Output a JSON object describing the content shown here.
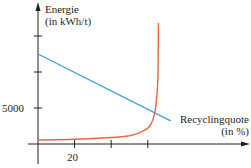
{
  "chart_data": {
    "type": "line",
    "title": "",
    "ylabel": "Energie (in kWh/t)",
    "xlabel": "Recyclingquote (in %)",
    "ylabel_lines": [
      "Energie",
      "(in kWh/t)"
    ],
    "xlabel_lines": [
      "Recyclingquote",
      "(in %)"
    ],
    "x_ticks": [
      20,
      40,
      60
    ],
    "x_tick_labels": [
      "20"
    ],
    "y_ticks": [
      5000,
      10000,
      15000
    ],
    "y_tick_labels": [
      "5000"
    ],
    "xlim": [
      -3,
      114
    ],
    "ylim": [
      -3000,
      20000
    ],
    "grid": false,
    "legend": "none",
    "series": [
      {
        "name": "Energie (linear, blau)",
        "color": "#3aa6d6",
        "x": [
          0,
          72.5
        ],
        "y": [
          12500,
          3200
        ]
      },
      {
        "name": "Energie (Kurve, orange)",
        "color": "#e8683a",
        "x": [
          0,
          20,
          40,
          50,
          55,
          60,
          62,
          63.5,
          64.5,
          65.5,
          65.8
        ],
        "y": [
          550,
          650,
          900,
          1150,
          1500,
          2200,
          2900,
          4000,
          5500,
          9000,
          16800
        ]
      }
    ]
  }
}
